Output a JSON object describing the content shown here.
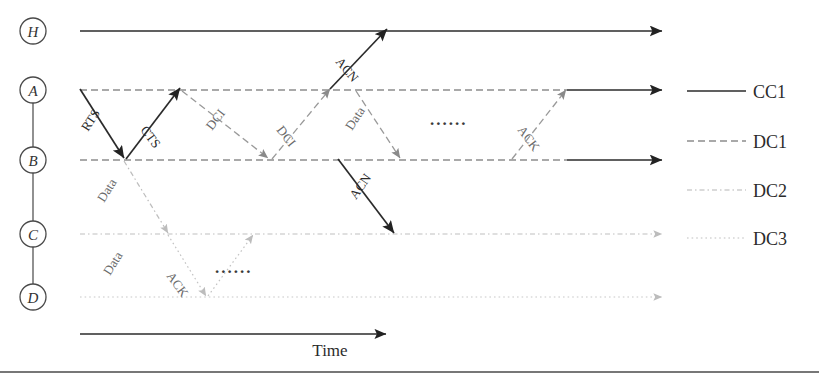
{
  "figure": {
    "type": "sequence-timing-diagram",
    "background": "#ffffff",
    "width": 819,
    "height": 382,
    "bottom_rule": true
  },
  "nodes": [
    {
      "id": "H",
      "label": "H",
      "cx": 33,
      "cy": 31
    },
    {
      "id": "A",
      "label": "A",
      "cx": 33,
      "cy": 90
    },
    {
      "id": "B",
      "label": "B",
      "cx": 33,
      "cy": 160
    },
    {
      "id": "C",
      "label": "C",
      "cx": 33,
      "cy": 234
    },
    {
      "id": "D",
      "label": "D",
      "cx": 33,
      "cy": 297
    }
  ],
  "node_chain": {
    "from": "A",
    "to": "D",
    "color": "#555555"
  },
  "timelines": [
    {
      "node": "H",
      "y": 31,
      "x1": 80,
      "x2": 662,
      "style": "CC1",
      "color": "#2b2b2b",
      "arrow": "dark",
      "solid_from": 80
    },
    {
      "node": "A",
      "y": 90,
      "x1": 80,
      "x2": 662,
      "style": "DC1",
      "color": "#8d8d8d",
      "arrow": "dark",
      "solid_from": 567
    },
    {
      "node": "B",
      "y": 160,
      "x1": 80,
      "x2": 662,
      "style": "DC1",
      "color": "#8d8d8d",
      "arrow": "dark",
      "solid_from": 567
    },
    {
      "node": "C",
      "y": 234,
      "x1": 80,
      "x2": 662,
      "style": "DC2",
      "color": "#c0c0c0",
      "arrow": "light",
      "solid_from": null
    },
    {
      "node": "D",
      "y": 297,
      "x1": 80,
      "x2": 662,
      "style": "DC3",
      "color": "#c8c8c8",
      "arrow": "light",
      "solid_from": null
    }
  ],
  "messages": [
    {
      "label": "RTS",
      "from": "A",
      "to": "B",
      "x1": 80,
      "y1": 89,
      "x2": 124,
      "y2": 158,
      "style": "CC1",
      "color": "#2b2b2b",
      "label_x": 88,
      "label_y": 132,
      "rotate": -57
    },
    {
      "label": "CTS",
      "from": "B",
      "to": "A",
      "x1": 126,
      "y1": 159,
      "x2": 180,
      "y2": 88,
      "style": "CC1",
      "color": "#2b2b2b",
      "label_x": 140,
      "label_y": 130,
      "rotate": 53
    },
    {
      "label": "Data",
      "from": "B",
      "to": "C",
      "x1": 124,
      "y1": 161,
      "x2": 168,
      "y2": 233,
      "style": "DC2",
      "color": "#bdbdbd",
      "label_x": 104,
      "label_y": 203,
      "rotate": -58
    },
    {
      "label": "Data",
      "from": "C",
      "to": "D",
      "x1": 168,
      "y1": 235,
      "x2": 206,
      "y2": 296,
      "style": "DC3",
      "color": "#c3c3c3",
      "label_x": 110,
      "label_y": 276,
      "rotate": -58
    },
    {
      "label": "ACK",
      "from": "D",
      "to": "C",
      "x1": 208,
      "y1": 296,
      "x2": 253,
      "y2": 235,
      "style": "DC3",
      "color": "#c3c3c3",
      "label_x": 166,
      "label_y": 276,
      "rotate": 54
    },
    {
      "label": "DCI",
      "from": "A",
      "to": "B",
      "x1": 182,
      "y1": 91,
      "x2": 268,
      "y2": 158,
      "style": "DC1",
      "color": "#9a9a9a",
      "label_x": 212,
      "label_y": 131,
      "rotate": -52
    },
    {
      "label": "DCI",
      "from": "B",
      "to": "A",
      "x1": 272,
      "y1": 159,
      "x2": 330,
      "y2": 89,
      "style": "DC1",
      "color": "#9a9a9a",
      "label_x": 276,
      "label_y": 130,
      "rotate": 52
    },
    {
      "label": "ACN",
      "from": "A",
      "to": "H",
      "x1": 330,
      "y1": 89,
      "x2": 387,
      "y2": 29,
      "style": "CC1",
      "color": "#2b2b2b",
      "label_x": 335,
      "label_y": 62,
      "rotate": 50
    },
    {
      "label": "ACN",
      "from": "B",
      "to": "C",
      "x1": 338,
      "y1": 159,
      "x2": 394,
      "y2": 233,
      "style": "CC1",
      "color": "#2b2b2b",
      "label_x": 356,
      "label_y": 200,
      "rotate": -55
    },
    {
      "label": "Data",
      "from": "A",
      "to": "B",
      "x1": 356,
      "y1": 91,
      "x2": 400,
      "y2": 158,
      "style": "DC1",
      "color": "#9a9a9a",
      "label_x": 352,
      "label_y": 131,
      "rotate": -57
    },
    {
      "label": "ACK",
      "from": "B",
      "to": "A",
      "x1": 512,
      "y1": 159,
      "x2": 566,
      "y2": 90,
      "style": "DC1",
      "color": "#9a9a9a",
      "label_x": 517,
      "label_y": 130,
      "rotate": 53
    }
  ],
  "ellipses": [
    {
      "text": "......",
      "x": 430,
      "y": 125
    },
    {
      "text": "......",
      "x": 215,
      "y": 273
    }
  ],
  "time_axis": {
    "label": "Time",
    "x1": 80,
    "x2": 386,
    "y": 334,
    "label_x": 330,
    "label_y": 356,
    "color": "#2b2b2b"
  },
  "legend": {
    "x_line_start": 687,
    "x_line_end": 746,
    "x_label": 753,
    "items": [
      {
        "label": "CC1",
        "style": "CC1",
        "color": "#2b2b2b",
        "y": 91
      },
      {
        "label": "DC1",
        "style": "DC1",
        "color": "#8d8d8d",
        "y": 141
      },
      {
        "label": "DC2",
        "style": "DC2",
        "color": "#b5b5b5",
        "y": 190
      },
      {
        "label": "DC3",
        "style": "DC3",
        "color": "#bfbfbf",
        "y": 238
      }
    ]
  },
  "line_styles": {
    "CC1": "solid",
    "DC1": "dashed",
    "DC2": "dash-dot",
    "DC3": "dotted"
  }
}
